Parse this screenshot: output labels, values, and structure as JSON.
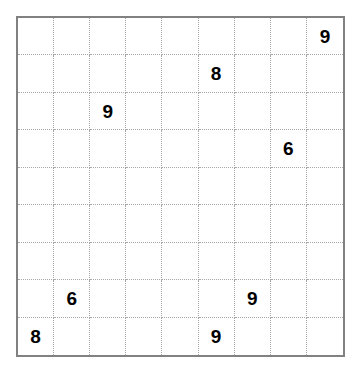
{
  "puzzle": {
    "type": "sudoku-grid",
    "rows": 9,
    "columns": 9,
    "outer_border_color": "#818181",
    "inner_line_color": "#a8a8a8",
    "digit_color": "#000000",
    "background_color": "#ffffff",
    "given_count": 8,
    "cells": [
      [
        "",
        "",
        "",
        "",
        "",
        "",
        "",
        "",
        "9"
      ],
      [
        "",
        "",
        "",
        "",
        "",
        "8",
        "",
        "",
        ""
      ],
      [
        "",
        "",
        "9",
        "",
        "",
        "",
        "",
        "",
        ""
      ],
      [
        "",
        "",
        "",
        "",
        "",
        "",
        "",
        "6",
        ""
      ],
      [
        "",
        "",
        "",
        "",
        "",
        "",
        "",
        "",
        ""
      ],
      [
        "",
        "",
        "",
        "",
        "",
        "",
        "",
        "",
        ""
      ],
      [
        "",
        "",
        "",
        "",
        "",
        "",
        "",
        "",
        ""
      ],
      [
        "",
        "6",
        "",
        "",
        "",
        "",
        "9",
        "",
        ""
      ],
      [
        "8",
        "",
        "",
        "",
        "",
        "9",
        "",
        "",
        ""
      ]
    ]
  }
}
